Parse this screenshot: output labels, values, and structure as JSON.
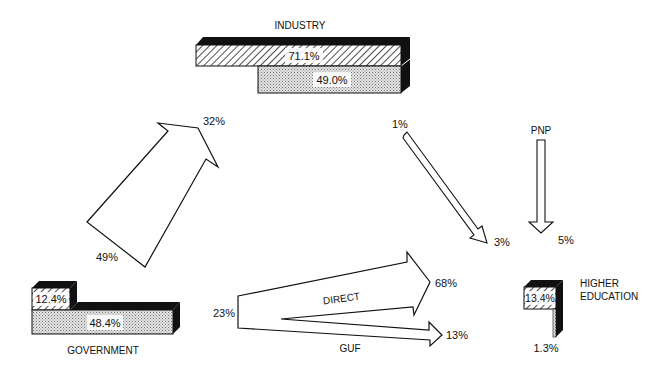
{
  "diagram": {
    "nodes": {
      "industry": {
        "label": "INDUSTRY",
        "bar_hatched_value": "71.1%",
        "bar_dotted_value": "49.0%"
      },
      "government": {
        "label": "GOVERNMENT",
        "bar_hatched_value": "12.4%",
        "bar_dotted_value": "48.4%"
      },
      "higher_education": {
        "label_line1": "HIGHER",
        "label_line2": "EDUCATION",
        "bar_hatched_value": "13.4%",
        "bar_dotted_value": "1.3%"
      },
      "pnp": {
        "label": "PNP"
      }
    },
    "flows": {
      "gov_to_industry": {
        "from_pct": "49%",
        "to_pct": "32%"
      },
      "industry_to_higher_ed": {
        "from_pct": "1%",
        "to_pct": "3%"
      },
      "pnp_to_higher_ed": {
        "to_pct": "5%"
      },
      "gov_to_higher_ed": {
        "from_pct": "23%",
        "direct_label": "DIRECT",
        "direct_pct": "68%",
        "guf_label": "GUF",
        "guf_pct": "13%"
      }
    }
  }
}
